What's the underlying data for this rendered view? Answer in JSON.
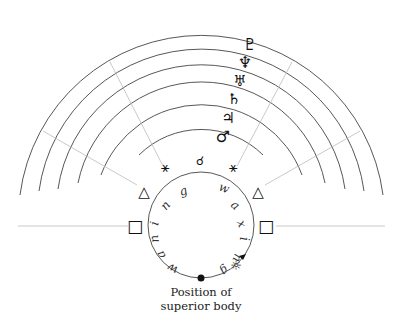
{
  "diagram": {
    "type": "planetary-aspects-orbit-diagram",
    "caption": {
      "line1": "Position of",
      "line2": "superior body"
    },
    "planets_outer_to_inner": [
      {
        "name": "Pluto",
        "symbol": "♇"
      },
      {
        "name": "Neptune",
        "symbol": "♆"
      },
      {
        "name": "Uranus",
        "symbol": "♅"
      },
      {
        "name": "Saturn",
        "symbol": "♄"
      },
      {
        "name": "Jupiter",
        "symbol": "♃"
      },
      {
        "name": "Mars",
        "symbol": "♂"
      }
    ],
    "aspects": {
      "conjunction": "☌",
      "sextile_left": "⚹",
      "sextile_right": "⚹",
      "trine_left": "△",
      "trine_right": "△",
      "square_left": "□",
      "square_right": "□"
    },
    "inner_circle": {
      "waxing_label": "waxing",
      "waning_label": "waning",
      "sun_symbol": "☼"
    },
    "colors": {
      "arc": "#444444",
      "aspect_line": "#bbbbbb",
      "text": "#111111"
    }
  }
}
